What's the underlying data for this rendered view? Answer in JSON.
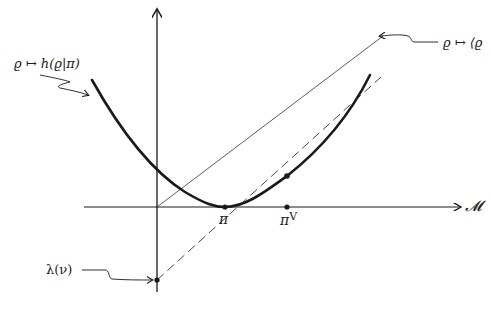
{
  "diagram": {
    "type": "function-graph",
    "axes": {
      "vertical_axis": {
        "has_arrow": true
      },
      "horizontal_axis": {
        "label": "𝓜",
        "has_arrow": true
      }
    },
    "curves": [
      {
        "name": "convex-curve",
        "label": "ϱ ↦ h(ϱ|π)",
        "style": "thick-solid"
      },
      {
        "name": "line-through-origin",
        "label": "ϱ ↦ ⟨ϱ",
        "style": "thin-solid"
      },
      {
        "name": "tangent-line",
        "style": "dashed"
      }
    ],
    "points": [
      {
        "name": "pi",
        "label": "π",
        "on": "horizontal-axis",
        "note": "minimum of curve"
      },
      {
        "name": "pi-v",
        "label": "π",
        "superscript": "V",
        "on": "horizontal-axis"
      },
      {
        "name": "tangent-point",
        "on": "curve"
      },
      {
        "name": "lambda-v",
        "label": "λ(ν)",
        "on": "vertical-axis",
        "note": "intercept of dashed tangent line"
      }
    ]
  },
  "labels": {
    "curve_label": "ϱ ↦ h(ϱ|π)",
    "line_label": "ϱ ↦ ⟨ϱ",
    "axis_label": "𝓜",
    "pi": "π",
    "pi_v": "π",
    "pi_v_sup": "V",
    "lambda_label": "λ(ν)"
  },
  "colors": {
    "ink": "#1a1a1a",
    "background": "#ffffff"
  }
}
